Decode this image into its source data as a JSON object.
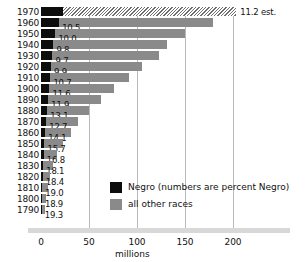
{
  "chart_data": {
    "type": "bar",
    "orientation": "horizontal",
    "title": "",
    "xlabel": "millions",
    "ylabel": "",
    "xlim": [
      0,
      230
    ],
    "xticks": [
      0,
      50,
      100,
      150,
      200
    ],
    "xticklabels": [
      "0",
      "50",
      "100",
      "150",
      "200"
    ],
    "grid": true,
    "grid_axis": "x",
    "legend_position": "inside-lower-right",
    "categories": [
      "1970",
      "1960",
      "1950",
      "1940",
      "1930",
      "1920",
      "1910",
      "1900",
      "1890",
      "1880",
      "1870",
      "1860",
      "1850",
      "1840",
      "1830",
      "1820",
      "1810",
      "1800",
      "1790"
    ],
    "series": [
      {
        "name": "Negro",
        "color": "#0d0d0d",
        "values": [
          22.8,
          18.9,
          15.0,
          12.9,
          11.9,
          10.5,
          9.8,
          8.8,
          7.5,
          6.6,
          5.4,
          4.4,
          3.6,
          2.9,
          2.3,
          1.8,
          1.4,
          1.0,
          0.8
        ]
      },
      {
        "name": "all other races",
        "color": "#8a8a8a",
        "values": [
          180.7,
          160.4,
          135.1,
          118.3,
          111.0,
          95.2,
          82.2,
          67.2,
          55.1,
          43.6,
          33.2,
          27.0,
          19.6,
          14.2,
          10.6,
          7.8,
          5.8,
          4.3,
          3.1
        ]
      }
    ],
    "totals": [
      203.5,
      179.3,
      150.1,
      131.2,
      122.9,
      105.7,
      92.0,
      76.0,
      62.6,
      50.2,
      38.6,
      31.4,
      23.2,
      17.1,
      12.9,
      9.6,
      7.2,
      5.3,
      3.9
    ],
    "point_labels": [
      "11.2 est.",
      "10.5",
      "10.0",
      "9.8",
      "9.7",
      "9.9",
      "10.7",
      "11.6",
      "11.9",
      "13.1",
      "12.7",
      "14.1",
      "15.7",
      "16.8",
      "18.1",
      "18.4",
      "19.0",
      "18.9",
      "19.3"
    ],
    "point_label_units": "percent Negro",
    "estimated_categories": [
      "1970"
    ],
    "annotations": [
      "11.2 est."
    ]
  },
  "axis": {
    "x_title": "millions",
    "ticks": [
      "0",
      "50",
      "100",
      "150",
      "200"
    ]
  },
  "legend": {
    "items": [
      {
        "label": "Negro (numbers are percent Negro)",
        "swatch": "black"
      },
      {
        "label": "all other races",
        "swatch": "gray"
      }
    ]
  },
  "years": [
    "1970",
    "1960",
    "1950",
    "1940",
    "1930",
    "1920",
    "1910",
    "1900",
    "1890",
    "1880",
    "1870",
    "1860",
    "1850",
    "1840",
    "1830",
    "1820",
    "1810",
    "1800",
    "1790"
  ],
  "pct": [
    "11.2 est.",
    "10.5",
    "10.0",
    "9.8",
    "9.7",
    "9.9",
    "10.7",
    "11.6",
    "11.9",
    "13.1",
    "12.7",
    "14.1",
    "15.7",
    "16.8",
    "18.1",
    "18.4",
    "19.0",
    "18.9",
    "19.3"
  ]
}
